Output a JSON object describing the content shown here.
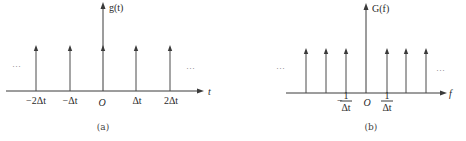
{
  "panel_a": {
    "y_label": "g(t)",
    "x_label": "t",
    "origin_label": "O",
    "ticks": [
      "−2Δt",
      "−Δt",
      "Δt",
      "2Δt"
    ],
    "ellipsis_left": "···",
    "ellipsis_right": "···",
    "caption": "(a)"
  },
  "panel_b": {
    "y_label": "G(f)",
    "x_label": "f",
    "origin_label": "O",
    "tick_neg_sign": "−",
    "tick_numerator": "1",
    "tick_denominator": "Δt",
    "ellipsis_left": "···",
    "ellipsis_right": "···",
    "caption": "(b)"
  },
  "colors": {
    "line": "#3a3a3a",
    "text": "#2a2a2a",
    "background": "#ffffff"
  }
}
